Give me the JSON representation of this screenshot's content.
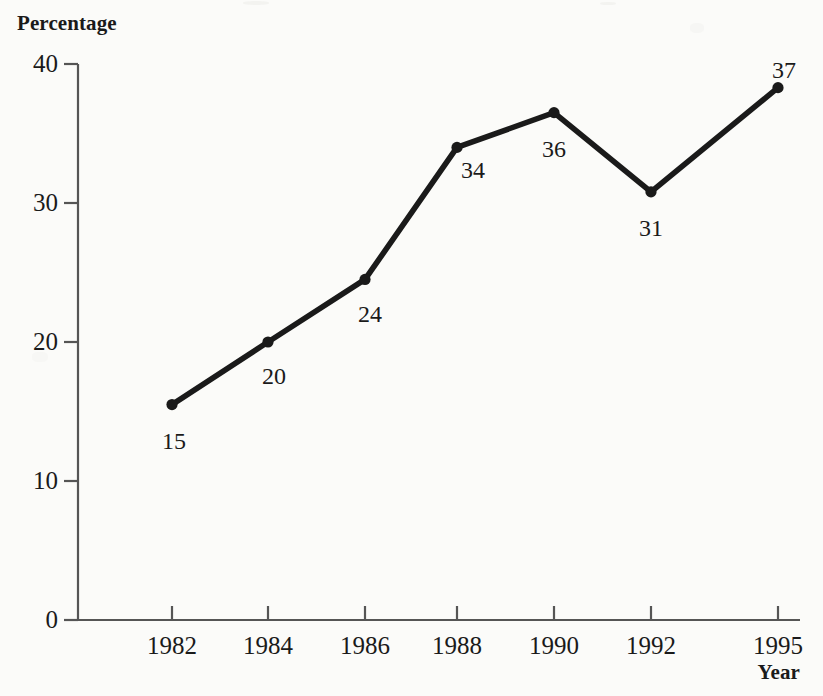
{
  "chart_data": {
    "type": "line",
    "title": "",
    "xlabel": "Year",
    "ylabel": "Percentage",
    "categories": [
      "1982",
      "1984",
      "1986",
      "1988",
      "1990",
      "1992",
      "1995"
    ],
    "values": [
      15,
      20,
      24,
      34,
      36,
      31,
      37
    ],
    "point_labels": [
      "15",
      "20",
      "24",
      "34",
      "36",
      "31",
      "37"
    ],
    "plotted_values": [
      15.5,
      20.0,
      24.5,
      34.0,
      36.5,
      30.8,
      38.3
    ],
    "ylim": [
      0,
      40
    ],
    "yticks": [
      "0",
      "10",
      "20",
      "30",
      "40"
    ],
    "ytick_values": [
      0,
      10,
      20,
      30,
      40
    ],
    "grid": false,
    "legend": null,
    "series_color": "#1a1a1a",
    "marker": "filled-circle"
  },
  "axes": {
    "y_title": "Percentage",
    "x_title": "Year"
  }
}
